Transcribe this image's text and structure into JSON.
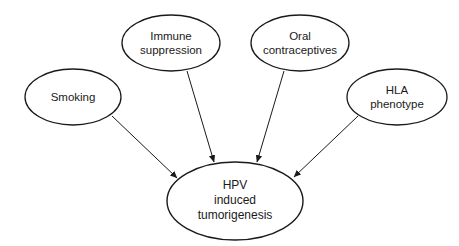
{
  "diagram": {
    "type": "influence-diagram",
    "nodes": [
      {
        "id": "smoking",
        "lines": [
          "Smoking"
        ]
      },
      {
        "id": "immune",
        "lines": [
          "Immune",
          "suppression"
        ]
      },
      {
        "id": "oral",
        "lines": [
          "Oral",
          "contraceptives"
        ]
      },
      {
        "id": "hla",
        "lines": [
          "HLA",
          "phenotype"
        ]
      },
      {
        "id": "hpv",
        "lines": [
          "HPV",
          "induced",
          "tumorigenesis"
        ]
      }
    ],
    "edges": [
      {
        "from": "smoking",
        "to": "hpv"
      },
      {
        "from": "immune",
        "to": "hpv"
      },
      {
        "from": "oral",
        "to": "hpv"
      },
      {
        "from": "hla",
        "to": "hpv"
      }
    ]
  }
}
